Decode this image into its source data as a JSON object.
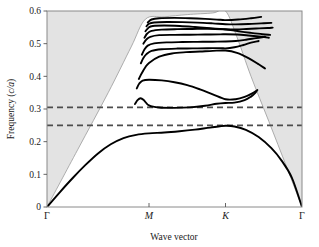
{
  "chart_data": {
    "type": "line",
    "title": "",
    "xlabel": "Wave vector",
    "ylabel": "Frequency (c/a)",
    "ylabel_main": "Frequency (",
    "ylabel_italic": "c/a",
    "ylabel_tail": ")",
    "ylim": [
      0,
      0.6
    ],
    "ytick_values": [
      0,
      0.1,
      0.2,
      0.3,
      0.4,
      0.5,
      0.6
    ],
    "ytick_labels": [
      "0",
      "0.1",
      "0.2",
      "0.3",
      "0.4",
      "0.5",
      "0.6"
    ],
    "xtick_labels": [
      "Γ",
      "M",
      "K",
      "Γ"
    ],
    "xtick_positions": [
      0,
      0.4,
      0.7,
      1.0
    ],
    "grid": false,
    "legend": "none",
    "annotations": [
      {
        "name": "bandgap-upper-edge",
        "type": "dashed-horizontal-line",
        "value": 0.305,
        "color": "#4d4d4d"
      },
      {
        "name": "bandgap-lower-edge",
        "type": "dashed-horizontal-line",
        "value": 0.25,
        "color": "#4d4d4d"
      }
    ],
    "shaded_region": {
      "name": "light-cone",
      "description": "grey shaded region above the light line",
      "color": "#e3e3e3"
    },
    "light_line": {
      "name": "light-line",
      "color": "#9a9a9a",
      "points": [
        [
          0.0,
          0.0
        ],
        [
          0.12,
          0.175
        ],
        [
          0.24,
          0.35
        ],
        [
          0.33,
          0.49
        ],
        [
          0.386,
          0.575
        ],
        [
          0.46,
          0.582
        ],
        [
          0.55,
          0.589
        ],
        [
          0.65,
          0.594
        ],
        [
          0.7,
          0.6
        ],
        [
          0.745,
          0.52
        ],
        [
          0.8,
          0.4
        ],
        [
          0.87,
          0.262
        ],
        [
          0.94,
          0.122
        ],
        [
          1.0,
          0.0
        ]
      ]
    },
    "series": [
      {
        "name": "band-1",
        "values": [
          [
            0.0,
            0.0
          ],
          [
            0.05,
            0.045
          ],
          [
            0.1,
            0.088
          ],
          [
            0.15,
            0.128
          ],
          [
            0.2,
            0.164
          ],
          [
            0.25,
            0.192
          ],
          [
            0.3,
            0.211
          ],
          [
            0.35,
            0.221
          ],
          [
            0.4,
            0.2255
          ],
          [
            0.46,
            0.228
          ],
          [
            0.52,
            0.232
          ],
          [
            0.58,
            0.237
          ],
          [
            0.64,
            0.243
          ],
          [
            0.7,
            0.2485
          ],
          [
            0.735,
            0.2465
          ],
          [
            0.78,
            0.236
          ],
          [
            0.83,
            0.214
          ],
          [
            0.88,
            0.18
          ],
          [
            0.92,
            0.142
          ],
          [
            0.96,
            0.09
          ],
          [
            1.0,
            0.0
          ]
        ]
      },
      {
        "name": "band-2",
        "values": [
          [
            0.345,
            0.315
          ],
          [
            0.355,
            0.327
          ],
          [
            0.367,
            0.333
          ],
          [
            0.38,
            0.327
          ],
          [
            0.4,
            0.311
          ],
          [
            0.44,
            0.3045
          ],
          [
            0.5,
            0.3035
          ],
          [
            0.56,
            0.305
          ],
          [
            0.62,
            0.31
          ],
          [
            0.665,
            0.316
          ],
          [
            0.7,
            0.3185
          ],
          [
            0.735,
            0.3195
          ],
          [
            0.775,
            0.327
          ],
          [
            0.8,
            0.338
          ],
          [
            0.815,
            0.348
          ],
          [
            0.822,
            0.355
          ]
        ]
      },
      {
        "name": "band-3",
        "values": [
          [
            0.352,
            0.363
          ],
          [
            0.362,
            0.378
          ],
          [
            0.375,
            0.387
          ],
          [
            0.4,
            0.3895
          ],
          [
            0.45,
            0.3875
          ],
          [
            0.5,
            0.382
          ],
          [
            0.55,
            0.373
          ],
          [
            0.6,
            0.36
          ],
          [
            0.65,
            0.345
          ],
          [
            0.7,
            0.33
          ],
          [
            0.74,
            0.33
          ],
          [
            0.775,
            0.337
          ],
          [
            0.805,
            0.348
          ],
          [
            0.825,
            0.358
          ]
        ]
      },
      {
        "name": "band-4",
        "values": [
          [
            0.36,
            0.392
          ],
          [
            0.372,
            0.41
          ],
          [
            0.385,
            0.427
          ],
          [
            0.4,
            0.441
          ],
          [
            0.44,
            0.46
          ],
          [
            0.49,
            0.47
          ],
          [
            0.545,
            0.474
          ],
          [
            0.6,
            0.476
          ],
          [
            0.65,
            0.478
          ],
          [
            0.7,
            0.479
          ],
          [
            0.745,
            0.472
          ],
          [
            0.79,
            0.456
          ],
          [
            0.83,
            0.437
          ],
          [
            0.855,
            0.424
          ]
        ]
      },
      {
        "name": "band-5",
        "values": [
          [
            0.368,
            0.44
          ],
          [
            0.378,
            0.456
          ],
          [
            0.39,
            0.468
          ],
          [
            0.41,
            0.478
          ],
          [
            0.45,
            0.483
          ],
          [
            0.51,
            0.485
          ],
          [
            0.57,
            0.4855
          ],
          [
            0.63,
            0.486
          ],
          [
            0.68,
            0.4865
          ],
          [
            0.7,
            0.4855
          ],
          [
            0.735,
            0.489
          ],
          [
            0.77,
            0.496
          ],
          [
            0.8,
            0.503
          ],
          [
            0.83,
            0.508
          ]
        ]
      },
      {
        "name": "band-6",
        "values": [
          [
            0.372,
            0.466
          ],
          [
            0.382,
            0.482
          ],
          [
            0.395,
            0.494
          ],
          [
            0.42,
            0.501
          ],
          [
            0.47,
            0.504
          ],
          [
            0.53,
            0.505
          ],
          [
            0.59,
            0.5055
          ],
          [
            0.65,
            0.506
          ],
          [
            0.7,
            0.5065
          ],
          [
            0.74,
            0.508
          ],
          [
            0.78,
            0.512
          ],
          [
            0.82,
            0.517
          ],
          [
            0.855,
            0.521
          ]
        ]
      },
      {
        "name": "band-7",
        "values": [
          [
            0.378,
            0.5
          ],
          [
            0.39,
            0.513
          ],
          [
            0.405,
            0.521
          ],
          [
            0.44,
            0.526
          ],
          [
            0.5,
            0.527
          ],
          [
            0.56,
            0.5275
          ],
          [
            0.62,
            0.528
          ],
          [
            0.68,
            0.5285
          ],
          [
            0.7,
            0.529
          ],
          [
            0.745,
            0.528
          ],
          [
            0.79,
            0.525
          ],
          [
            0.84,
            0.521
          ],
          [
            0.87,
            0.518
          ]
        ]
      },
      {
        "name": "band-8",
        "values": [
          [
            0.382,
            0.518
          ],
          [
            0.393,
            0.531
          ],
          [
            0.41,
            0.539
          ],
          [
            0.45,
            0.543
          ],
          [
            0.51,
            0.5445
          ],
          [
            0.57,
            0.545
          ],
          [
            0.63,
            0.5455
          ],
          [
            0.69,
            0.544
          ],
          [
            0.72,
            0.542
          ],
          [
            0.76,
            0.537
          ],
          [
            0.8,
            0.533
          ],
          [
            0.845,
            0.529
          ],
          [
            0.875,
            0.527
          ]
        ]
      },
      {
        "name": "band-9",
        "values": [
          [
            0.386,
            0.538
          ],
          [
            0.398,
            0.549
          ],
          [
            0.415,
            0.554
          ],
          [
            0.46,
            0.5555
          ],
          [
            0.52,
            0.554
          ],
          [
            0.58,
            0.551
          ],
          [
            0.64,
            0.5475
          ],
          [
            0.69,
            0.5445
          ],
          [
            0.72,
            0.5435
          ],
          [
            0.77,
            0.5445
          ],
          [
            0.82,
            0.5465
          ],
          [
            0.865,
            0.548
          ],
          [
            0.885,
            0.549
          ]
        ]
      },
      {
        "name": "band-10",
        "values": [
          [
            0.39,
            0.553
          ],
          [
            0.4,
            0.561
          ],
          [
            0.42,
            0.565
          ],
          [
            0.47,
            0.5665
          ],
          [
            0.53,
            0.566
          ],
          [
            0.59,
            0.5645
          ],
          [
            0.65,
            0.562
          ],
          [
            0.7,
            0.5595
          ],
          [
            0.74,
            0.559
          ],
          [
            0.79,
            0.56
          ],
          [
            0.84,
            0.562
          ],
          [
            0.88,
            0.5635
          ]
        ]
      },
      {
        "name": "band-11",
        "values": [
          [
            0.395,
            0.565
          ],
          [
            0.41,
            0.574
          ],
          [
            0.44,
            0.578
          ],
          [
            0.5,
            0.579
          ],
          [
            0.56,
            0.578
          ],
          [
            0.62,
            0.576
          ],
          [
            0.68,
            0.573
          ],
          [
            0.7,
            0.572
          ],
          [
            0.75,
            0.574
          ],
          [
            0.8,
            0.578
          ],
          [
            0.84,
            0.582
          ]
        ]
      }
    ]
  },
  "axes": {
    "frame_color": "#808080",
    "line_color": "#000000"
  }
}
